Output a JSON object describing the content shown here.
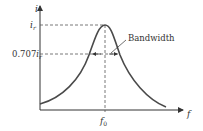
{
  "diagram": {
    "y_axis_label": "i",
    "x_axis_label": "f",
    "peak_label_main": "i",
    "peak_label_sub": "r",
    "half_power_label_coef": "0.707",
    "half_power_label_main": "i",
    "half_power_label_sub": "r",
    "resonant_freq_main": "f",
    "resonant_freq_sub": "0",
    "annotation": "Bandwidth",
    "colors": {
      "curve": "#4a4a4a",
      "axis": "#333333",
      "dashed": "#555555",
      "text": "#333333"
    }
  }
}
